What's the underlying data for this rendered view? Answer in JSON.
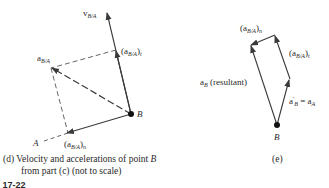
{
  "left_figure": {
    "labels": {
      "v_ba_main": "v",
      "v_ba_sub": "B/A",
      "a_ba_main": "a",
      "a_ba_sub": "B/A",
      "at_open": "(a",
      "at_sub": "B/A",
      "at_close": ")",
      "at_comp": "t",
      "an_open": "(a",
      "an_sub": "B/A",
      "an_close": ")",
      "an_comp": "n",
      "point_a": "A",
      "point_b": "B"
    },
    "caption_line1": "(d)  Velocity and accelerations of point ",
    "caption_point": "B",
    "caption_line2": "from part (c) (not to scale)"
  },
  "right_figure": {
    "labels": {
      "an_open": "(a",
      "an_sub": "B/A",
      "an_close": ")",
      "an_comp": "n",
      "at_open": "(a",
      "at_sub": "B/A",
      "at_close": ")",
      "at_comp": "t",
      "ab_main": "a",
      "ab_sub": "B",
      "ab_rest": " (resultant)",
      "apb_main": "a",
      "apb_sup": "′",
      "apb_sub": "B",
      "apb_eq": " = a",
      "apb_eq_sub": "A",
      "point_b": "B"
    },
    "caption": "(e)"
  },
  "figure_number": "E 17-22",
  "colors": {
    "line": "#3a3a3a",
    "dashed": "#555555",
    "point": "#111111"
  }
}
